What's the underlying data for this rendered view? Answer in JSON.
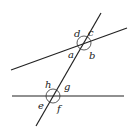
{
  "diagram": {
    "type": "geometry-angles",
    "lines": [
      {
        "id": "upper-line",
        "x1": 11,
        "y1": 70,
        "x2": 127,
        "y2": 28
      },
      {
        "id": "lower-line",
        "x1": 12,
        "y1": 96,
        "x2": 124,
        "y2": 96
      },
      {
        "id": "transversal",
        "x1": 36,
        "y1": 126,
        "x2": 101,
        "y2": 13
      }
    ],
    "intersections": [
      {
        "id": "upper",
        "cx": 84,
        "cy": 43,
        "r": 7
      },
      {
        "id": "lower",
        "cx": 53,
        "cy": 96,
        "r": 7
      }
    ],
    "labels": {
      "a": "a",
      "b": "b",
      "c": "c",
      "d": "d",
      "e": "e",
      "f": "f",
      "g": "g",
      "h": "h"
    },
    "colors": {
      "stroke": "#222222",
      "background": "#ffffff"
    }
  }
}
